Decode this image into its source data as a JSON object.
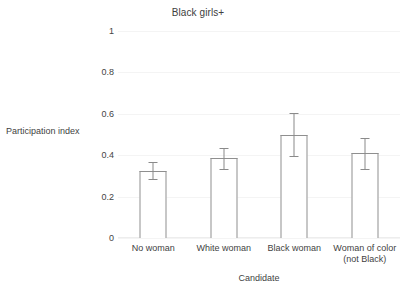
{
  "chart_data": {
    "type": "bar",
    "title": "Black girls+",
    "xlabel": "Candidate",
    "ylabel": "Participation index",
    "categories": [
      "No woman",
      "White woman",
      "Black woman",
      "Woman of color (not Black)"
    ],
    "category_lines": [
      [
        "No woman"
      ],
      [
        "White woman"
      ],
      [
        "Black woman"
      ],
      [
        "Woman of color",
        "(not Black)"
      ]
    ],
    "values": [
      0.325,
      0.385,
      0.5,
      0.41
    ],
    "errors": [
      0.04,
      0.05,
      0.105,
      0.075
    ],
    "error_low": [
      0.285,
      0.335,
      0.395,
      0.335
    ],
    "error_high": [
      0.365,
      0.435,
      0.605,
      0.485
    ],
    "ylim": [
      0,
      1
    ],
    "yticks": [
      0,
      0.2,
      0.4,
      0.6,
      0.8,
      1
    ],
    "ytick_labels": [
      "0",
      "0.2",
      "0.4",
      "0.6",
      "0.8",
      "1"
    ],
    "grid": true,
    "legend": null,
    "bar_fill": "#ffffff",
    "bar_edge": "#8f8f8f",
    "error_color": "#8a8a8a",
    "grid_color": "#f4f4f4",
    "text_color": "#3f3f3f"
  }
}
